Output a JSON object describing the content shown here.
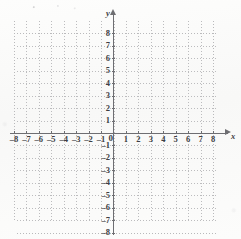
{
  "figure": {
    "type": "coordinate-grid",
    "title": "",
    "background_color": "#fbfbfa",
    "grid_color": "#b9b9bb",
    "axis_color": "#6e6e72",
    "label_color": "#3d3d42"
  },
  "axes": {
    "x_axis_name": "x",
    "y_axis_name": "y",
    "origin_label": "0",
    "x_ticks": [
      "–8",
      "–7",
      "–6",
      "–5",
      "–4",
      "–3",
      "–2",
      "–1",
      "1",
      "2",
      "3",
      "4",
      "5",
      "6",
      "7",
      "8"
    ],
    "y_ticks_positive": [
      "8",
      "7",
      "6",
      "5",
      "4",
      "3",
      "2",
      "1"
    ],
    "y_ticks_negative": [
      "–1",
      "–2",
      "–3",
      "–4",
      "–5",
      "–6",
      "–7",
      "–8"
    ]
  },
  "chart_data": {
    "type": "scatter",
    "title": "",
    "subtitle": "",
    "xlabel": "x",
    "ylabel": "y",
    "xlim": [
      -8,
      8
    ],
    "ylim": [
      -8,
      8
    ],
    "xticks": [
      -8,
      -7,
      -6,
      -5,
      -4,
      -3,
      -2,
      -1,
      0,
      1,
      2,
      3,
      4,
      5,
      6,
      7,
      8
    ],
    "yticks": [
      -8,
      -7,
      -6,
      -5,
      -4,
      -3,
      -2,
      -1,
      0,
      1,
      2,
      3,
      4,
      5,
      6,
      7,
      8
    ],
    "xtick_labels": [
      "–8",
      "–7",
      "–6",
      "–5",
      "–4",
      "–3",
      "–2",
      "–1",
      "0",
      "1",
      "2",
      "3",
      "4",
      "5",
      "6",
      "7",
      "8"
    ],
    "ytick_labels": [
      "–8",
      "–7",
      "–6",
      "–5",
      "–4",
      "–3",
      "–2",
      "–1",
      "0",
      "1",
      "2",
      "3",
      "4",
      "5",
      "6",
      "7",
      "8"
    ],
    "grid": true,
    "grid_style": "dotted",
    "grid_spacing": 1,
    "legend": null,
    "legend_position": "none",
    "series": [],
    "annotations": []
  }
}
